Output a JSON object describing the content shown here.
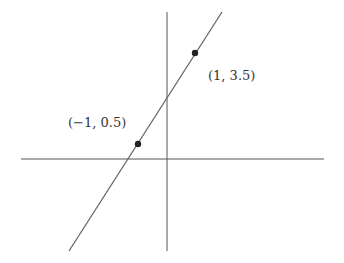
{
  "diagram": {
    "type": "cartesian-line-through-two-points",
    "axes": {
      "x_axis": {
        "x1": 21,
        "y1": 159,
        "x2": 324,
        "y2": 159
      },
      "y_axis": {
        "x1": 167,
        "y1": 12,
        "x2": 167,
        "y2": 251
      },
      "color": "#555555"
    },
    "line": {
      "x1": 69,
      "y1": 251,
      "x2": 222,
      "y2": 12,
      "color": "#666666"
    },
    "points": [
      {
        "label": "(1, 3.5)",
        "cx": 195,
        "cy": 53,
        "label_x": 208,
        "label_y": 80
      },
      {
        "label": "(−1, 0.5)",
        "cx": 138,
        "cy": 144,
        "label_x": 68,
        "label_y": 127
      }
    ],
    "point_color": "#222222"
  },
  "chart_data": {
    "type": "line",
    "title": "",
    "xlabel": "",
    "ylabel": "",
    "series": [
      {
        "name": "line",
        "x": [
          -1,
          1
        ],
        "y": [
          0.5,
          3.5
        ]
      }
    ],
    "annotations": [
      "(1, 3.5)",
      "(−1, 0.5)"
    ],
    "slope": 1.5,
    "intercept": 2,
    "grid": false
  }
}
